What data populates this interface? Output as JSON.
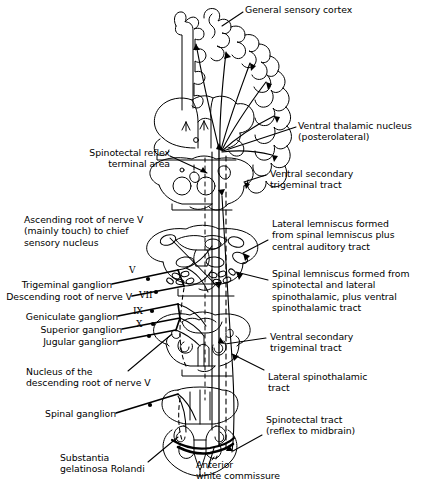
{
  "figure": {
    "background": "#ffffff",
    "ink": "#000000",
    "width": 430,
    "height": 491
  },
  "labels": {
    "general_sensory_cortex": "General sensory cortex",
    "ventral_thalamic_nucleus": "Ventral thalamic nucleus\n(posterolateral)",
    "spinotectal_reflex_terminal_area": "Spinotectal reflex\nterminal area",
    "ventral_secondary_trigeminal_tract_upper": "Ventral secondary\ntrigeminal tract",
    "ascending_root_nerve_v": "Ascending root of nerve V\n(mainly touch) to chief\nsensory nucleus",
    "lateral_lemniscus": "Lateral lemniscus formed\nfrom spinal lemniscus plus\ncentral auditory tract",
    "spinal_lemniscus": "Spinal lemniscus formed from\nspinotectal and lateral\nspinothalamic, plus ventral\nspinothalamic tract",
    "trigeminal_ganglion": "Trigeminal ganglion",
    "descending_root_nerve_v": "Descending root of nerve V",
    "geniculate_ganglion": "Geniculate ganglion",
    "superior_ganglion": "Superior ganglion",
    "jugular_ganglion": "Jugular ganglion",
    "ventral_secondary_trigeminal_tract_lower": "Ventral secondary\ntrigeminal tract",
    "nucleus_descending_root_nerve_v": "Nucleus of the\ndescending root of nerve V",
    "lateral_spinothalamic_tract": "Lateral spinothalamic\ntract",
    "spinal_ganglion": "Spinal ganglion",
    "spinotectal_tract": "Spinotectal tract\n(reflex to midbrain)",
    "substantia_gelatinosa_rolandi": "Substantia\ngelatinosa Rolandi",
    "anterior_white_commissure": "Anterior\nwhite commissure"
  },
  "nerve_markers": {
    "trigeminal": "V",
    "facial": "VII",
    "glossopharyngeal": "IX",
    "vagus": "X"
  },
  "sections": {
    "cerebrum": "cerebral-hemisphere-and-thalamus",
    "midbrain": "midbrain-section",
    "pons": "pons-section",
    "medulla": "medulla-section",
    "spinal_cord": "spinal-cord-section"
  }
}
